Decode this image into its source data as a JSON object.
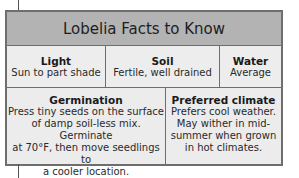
{
  "title": "Lobelia Facts to Know",
  "facts": {
    "light": {
      "heading": "Light",
      "value": "Sun to part shade"
    },
    "soil": {
      "heading": "Soil",
      "value": "Fertile, well drained"
    },
    "water": {
      "heading": "Water",
      "value": "Average"
    }
  },
  "germination": {
    "heading": "Germination",
    "text": "Press tiny seeds on the surface\nof damp soil-less mix. Germinate\nat 70°F, then move seedlings to\na cooler location."
  },
  "preferred_climate": {
    "heading": "Preferred climate",
    "text": "Prefers cool weather.\nMay wither in mid-\nsummer when grown\nin hot climates."
  },
  "colors": {
    "title_bar": "#b3b3b3",
    "border": "#6e6e6e",
    "panel": "#ededed"
  }
}
